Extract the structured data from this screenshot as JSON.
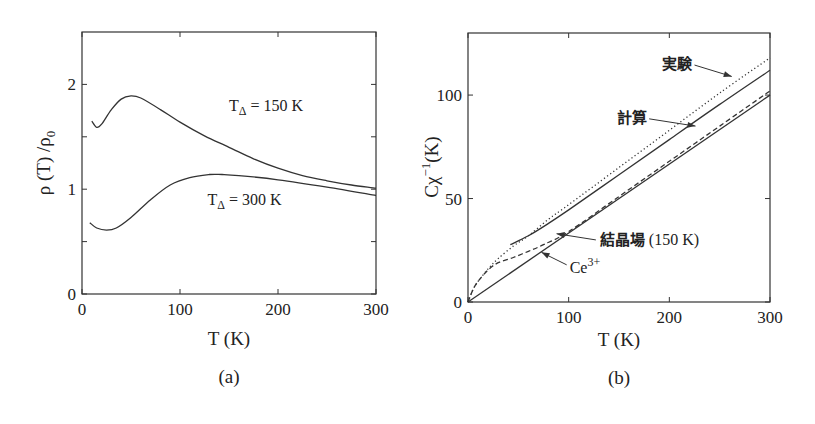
{
  "chart_data": [
    {
      "id": "a",
      "type": "line",
      "caption": "(a)",
      "title": "",
      "xlabel": "T (K)",
      "ylabel": "ρ (T) /ρ0",
      "xlim": [
        0,
        300
      ],
      "ylim": [
        0,
        2.5
      ],
      "xticks": [
        0,
        100,
        200,
        300
      ],
      "xticklabels": [
        "0",
        "100",
        "200",
        "300"
      ],
      "yticks": [
        0,
        1,
        2
      ],
      "yticklabels": [
        "0",
        "1",
        "2"
      ],
      "yminorticks": [
        0.5,
        1.5
      ],
      "grid": false,
      "legend": "none (inline annotations)",
      "series": [
        {
          "name": "TΔ = 150 K",
          "style": "solid",
          "x": [
            10,
            15,
            20,
            30,
            40,
            50,
            60,
            80,
            100,
            125,
            150,
            175,
            200,
            225,
            250,
            275,
            300
          ],
          "y": [
            1.65,
            1.59,
            1.62,
            1.76,
            1.86,
            1.89,
            1.87,
            1.76,
            1.64,
            1.51,
            1.4,
            1.29,
            1.2,
            1.13,
            1.08,
            1.04,
            1.01
          ]
        },
        {
          "name": "TΔ = 300 K",
          "style": "solid",
          "x": [
            8,
            15,
            25,
            35,
            50,
            70,
            90,
            110,
            130,
            143,
            160,
            200,
            250,
            300
          ],
          "y": [
            0.68,
            0.63,
            0.61,
            0.63,
            0.73,
            0.9,
            1.04,
            1.11,
            1.14,
            1.14,
            1.13,
            1.09,
            1.02,
            0.94
          ]
        }
      ],
      "annotations": [
        {
          "text_main": "T",
          "text_sub": "Δ",
          "text_rest": " = 150 K",
          "x": 150,
          "y": 1.75
        },
        {
          "text_main": "T",
          "text_sub": "Δ",
          "text_rest": " = 300 K",
          "x": 128,
          "y": 0.85
        }
      ]
    },
    {
      "id": "b",
      "type": "line",
      "caption": "(b)",
      "title": "",
      "xlabel": "T (K)",
      "ylabel_main": "Cχ",
      "ylabel_sup": "−1",
      "ylabel_rest": "(K)",
      "xlim": [
        0,
        300
      ],
      "ylim": [
        0,
        130
      ],
      "xticks": [
        0,
        100,
        200,
        300
      ],
      "xticklabels": [
        "0",
        "100",
        "200",
        "300"
      ],
      "yticks": [
        0,
        50,
        100
      ],
      "yticklabels": [
        "0",
        "50",
        "100"
      ],
      "grid": false,
      "legend": "none (arrow annotations)",
      "series": [
        {
          "name": "実験",
          "style": "dotted",
          "x": [
            0,
            5,
            10,
            20,
            30,
            45,
            60,
            80,
            100,
            150,
            200,
            250,
            300
          ],
          "y": [
            0,
            6,
            10,
            16,
            21,
            27,
            32,
            40,
            47,
            65,
            83,
            101,
            118
          ]
        },
        {
          "name": "計算",
          "style": "solid",
          "x": [
            42,
            60,
            80,
            100,
            150,
            200,
            250,
            300
          ],
          "y": [
            27.7,
            32,
            38,
            44.5,
            61.5,
            78.5,
            95.5,
            112
          ]
        },
        {
          "name": "結晶場 (150 K)",
          "style": "dashed",
          "x": [
            0,
            5,
            10,
            20,
            30,
            45,
            60,
            75,
            100,
            150,
            200,
            250,
            300
          ],
          "y": [
            0,
            6,
            10,
            15.5,
            19,
            21.5,
            24.5,
            27.7,
            34,
            51,
            68,
            85,
            102
          ]
        },
        {
          "name": "Ce3+",
          "style": "solid",
          "x": [
            0,
            300
          ],
          "y": [
            0,
            100
          ]
        }
      ],
      "annotations": [
        {
          "text": "実験",
          "label_x": 223,
          "label_y": 115,
          "arrow_to_x": 262,
          "arrow_to_y": 109
        },
        {
          "text": "計算",
          "label_x": 178,
          "label_y": 89,
          "arrow_to_x": 226,
          "arrow_to_y": 85
        },
        {
          "text_main": "結晶場",
          "text_rest": " (150 K)",
          "label_x": 131,
          "label_y": 30,
          "arrow_to_x": 88,
          "arrow_to_y": 33
        },
        {
          "text_main": "Ce",
          "text_sup": "3+",
          "label_x": 101,
          "label_y": 16.5,
          "arrow_to_x": 73,
          "arrow_to_y": 24
        }
      ]
    }
  ]
}
